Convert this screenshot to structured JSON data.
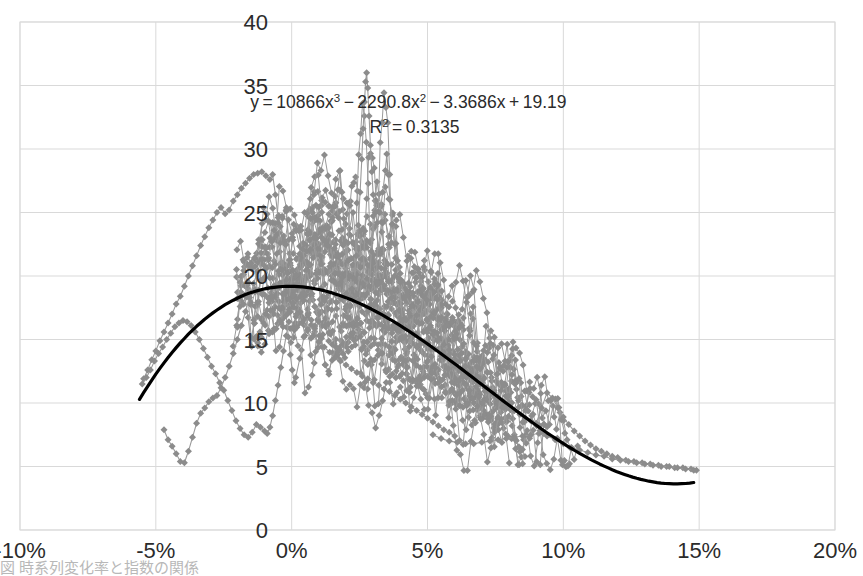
{
  "chart_data": {
    "type": "scatter",
    "title": "",
    "xlabel": "",
    "ylabel": "",
    "xlim": [
      -10,
      20
    ],
    "ylim": [
      0,
      40
    ],
    "xticks": [
      "-10%",
      "-5%",
      "0%",
      "5%",
      "10%",
      "15%",
      "20%"
    ],
    "xtick_values": [
      -10,
      -5,
      0,
      5,
      10,
      15,
      20
    ],
    "yticks": [
      "0",
      "5",
      "10",
      "15",
      "20",
      "25",
      "30",
      "35",
      "40"
    ],
    "ytick_values": [
      0,
      5,
      10,
      15,
      20,
      25,
      30,
      35,
      40
    ],
    "grid": true,
    "legend": "none",
    "marker": {
      "shape": "diamond",
      "color": "#8c8c8c",
      "size": 7,
      "connected": true,
      "line_color": "#9a9a9a"
    },
    "trendline": {
      "type": "polynomial",
      "order": 3,
      "color": "#000000",
      "width": 3.2,
      "equation": "y = 10866x³ − 2290.8x² − 3.3686x + 19.19",
      "coefficients": {
        "x3": 10866,
        "x2": -2290.8,
        "x1": -3.3686,
        "x0": 19.19
      },
      "r_squared": 0.3135,
      "x_start": -5.6,
      "x_end": 14.9
    },
    "annotations": [
      {
        "name": "trendline-equation",
        "lines": [
          "y = 10866x³ − 2290.8x² − 3.3686x + 19.19",
          "R² = 0.3135"
        ],
        "x": 4.3,
        "y": 33.2
      }
    ],
    "series": [
      {
        "name": "series-1",
        "points": [
          [
            -5.45,
            11.9
          ],
          [
            -5.3,
            12.6
          ],
          [
            -5.15,
            13.4
          ],
          [
            -5.0,
            14.1
          ],
          [
            -4.85,
            14.9
          ],
          [
            -4.7,
            15.6
          ],
          [
            -4.55,
            16.3
          ],
          [
            -4.4,
            17.0
          ],
          [
            -4.25,
            17.8
          ],
          [
            -4.1,
            18.4
          ],
          [
            -3.95,
            19.2
          ],
          [
            -3.8,
            20.0
          ],
          [
            -3.65,
            20.8
          ],
          [
            -3.5,
            21.6
          ],
          [
            -3.35,
            22.4
          ],
          [
            -3.2,
            23.1
          ],
          [
            -3.05,
            23.8
          ],
          [
            -2.9,
            24.4
          ],
          [
            -2.75,
            25.0
          ],
          [
            -2.6,
            25.4
          ],
          [
            -2.45,
            24.9
          ],
          [
            -2.3,
            25.2
          ],
          [
            -2.15,
            25.9
          ],
          [
            -2.0,
            26.4
          ],
          [
            -1.85,
            26.9
          ],
          [
            -1.7,
            27.3
          ],
          [
            -1.55,
            27.7
          ],
          [
            -1.4,
            28.0
          ],
          [
            -1.25,
            28.1
          ],
          [
            -1.1,
            28.2
          ],
          [
            -0.95,
            27.9
          ],
          [
            -0.8,
            27.6
          ],
          [
            -0.7,
            28.0
          ],
          [
            -0.6,
            26.4
          ],
          [
            -0.5,
            24.6
          ],
          [
            -0.42,
            22.6
          ],
          [
            -0.35,
            20.5
          ],
          [
            -0.28,
            18.6
          ],
          [
            -0.2,
            16.9
          ],
          [
            -0.12,
            15.2
          ],
          [
            -0.05,
            13.8
          ],
          [
            0.02,
            12.6
          ],
          [
            0.1,
            11.6
          ]
        ]
      },
      {
        "name": "series-2",
        "points": [
          [
            -5.5,
            11.5
          ],
          [
            -5.35,
            12.0
          ],
          [
            -5.2,
            12.6
          ],
          [
            -5.05,
            13.3
          ],
          [
            -4.9,
            13.9
          ],
          [
            -4.75,
            14.4
          ],
          [
            -4.6,
            15.0
          ],
          [
            -4.45,
            15.5
          ],
          [
            -4.3,
            16.0
          ],
          [
            -4.15,
            16.3
          ],
          [
            -4.0,
            16.5
          ],
          [
            -3.85,
            16.4
          ],
          [
            -3.7,
            16.1
          ],
          [
            -3.55,
            15.6
          ],
          [
            -3.4,
            15.0
          ],
          [
            -3.25,
            14.3
          ],
          [
            -3.1,
            13.6
          ],
          [
            -2.95,
            12.9
          ],
          [
            -2.8,
            12.3
          ],
          [
            -2.65,
            11.6
          ],
          [
            -2.5,
            11.0
          ],
          [
            -2.35,
            10.2
          ],
          [
            -2.2,
            9.4
          ],
          [
            -2.05,
            8.6
          ],
          [
            -1.9,
            8.0
          ],
          [
            -1.75,
            7.5
          ],
          [
            -1.6,
            7.3
          ],
          [
            -1.45,
            7.7
          ],
          [
            -1.3,
            8.3
          ],
          [
            -1.15,
            8.1
          ],
          [
            -1.0,
            7.8
          ],
          [
            -0.9,
            7.6
          ],
          [
            -0.8,
            8.1
          ],
          [
            -0.7,
            9.0
          ],
          [
            -0.6,
            10.2
          ],
          [
            -0.5,
            11.4
          ],
          [
            -0.4,
            12.8
          ],
          [
            -0.3,
            14.1
          ],
          [
            -0.2,
            15.3
          ],
          [
            -0.1,
            16.4
          ]
        ]
      },
      {
        "name": "series-3",
        "points": [
          [
            -4.7,
            7.9
          ],
          [
            -4.55,
            7.1
          ],
          [
            -4.4,
            6.6
          ],
          [
            -4.25,
            6.0
          ],
          [
            -4.1,
            5.4
          ],
          [
            -3.95,
            5.3
          ],
          [
            -3.8,
            6.2
          ],
          [
            -3.65,
            7.3
          ],
          [
            -3.5,
            8.4
          ],
          [
            -3.35,
            9.2
          ],
          [
            -3.2,
            9.6
          ],
          [
            -3.05,
            10.1
          ],
          [
            -2.9,
            10.4
          ],
          [
            -2.75,
            10.6
          ],
          [
            -2.6,
            11.2
          ],
          [
            -2.45,
            12.0
          ],
          [
            -2.3,
            12.9
          ],
          [
            -2.15,
            13.9
          ],
          [
            -2.0,
            15.0
          ],
          [
            -1.85,
            16.1
          ],
          [
            -1.7,
            17.2
          ],
          [
            -1.55,
            18.3
          ],
          [
            -1.4,
            19.4
          ],
          [
            -1.25,
            20.4
          ],
          [
            -1.1,
            21.3
          ],
          [
            -0.95,
            22.2
          ],
          [
            -0.8,
            23.0
          ],
          [
            -0.65,
            23.6
          ],
          [
            -0.5,
            24.2
          ],
          [
            -0.35,
            24.7
          ],
          [
            -0.2,
            25.1
          ],
          [
            -0.05,
            25.3
          ],
          [
            0.1,
            24.8
          ],
          [
            0.25,
            23.6
          ],
          [
            0.4,
            22.1
          ],
          [
            0.55,
            20.5
          ],
          [
            0.7,
            19.0
          ],
          [
            0.85,
            17.6
          ],
          [
            1.0,
            16.4
          ],
          [
            1.15,
            15.4
          ]
        ]
      },
      {
        "name": "series-4",
        "points": [
          [
            0.15,
            12.0
          ],
          [
            0.3,
            13.5
          ],
          [
            0.45,
            15.2
          ],
          [
            0.6,
            16.9
          ],
          [
            0.75,
            18.6
          ],
          [
            0.9,
            20.2
          ],
          [
            1.05,
            21.6
          ],
          [
            1.2,
            22.8
          ],
          [
            1.35,
            23.8
          ],
          [
            1.5,
            24.6
          ],
          [
            1.6,
            25.5
          ],
          [
            1.7,
            26.8
          ],
          [
            1.78,
            28.3
          ],
          [
            1.85,
            26.6
          ],
          [
            1.92,
            24.5
          ],
          [
            2.0,
            22.7
          ],
          [
            2.08,
            21.2
          ],
          [
            2.15,
            20.0
          ],
          [
            2.22,
            19.0
          ],
          [
            2.3,
            19.8
          ],
          [
            2.38,
            21.6
          ],
          [
            2.45,
            24.0
          ],
          [
            2.52,
            26.6
          ],
          [
            2.58,
            29.2
          ],
          [
            2.63,
            31.6
          ],
          [
            2.68,
            33.7
          ],
          [
            2.72,
            35.3
          ],
          [
            2.76,
            36.0
          ],
          [
            2.8,
            34.8
          ],
          [
            2.85,
            32.6
          ],
          [
            2.9,
            30.3
          ],
          [
            2.95,
            28.2
          ],
          [
            3.0,
            26.4
          ],
          [
            3.08,
            25.0
          ],
          [
            3.15,
            24.2
          ],
          [
            3.25,
            25.0
          ],
          [
            3.35,
            26.6
          ],
          [
            3.45,
            28.3
          ],
          [
            3.5,
            29.6
          ],
          [
            3.55,
            28.0
          ],
          [
            3.62,
            26.0
          ],
          [
            3.7,
            24.1
          ],
          [
            3.8,
            22.5
          ],
          [
            3.9,
            21.2
          ],
          [
            4.0,
            20.2
          ]
        ]
      },
      {
        "name": "series-5",
        "points": [
          [
            0.2,
            17.0
          ],
          [
            0.4,
            16.4
          ],
          [
            0.6,
            15.8
          ],
          [
            0.8,
            15.3
          ],
          [
            1.0,
            14.8
          ],
          [
            1.2,
            14.4
          ],
          [
            1.4,
            14.0
          ],
          [
            1.6,
            13.6
          ],
          [
            1.8,
            13.3
          ],
          [
            2.0,
            13.0
          ],
          [
            2.2,
            12.7
          ],
          [
            2.4,
            12.4
          ],
          [
            2.6,
            12.1
          ],
          [
            2.8,
            11.9
          ],
          [
            3.0,
            11.6
          ],
          [
            3.2,
            11.4
          ],
          [
            3.4,
            11.1
          ],
          [
            3.6,
            10.9
          ],
          [
            3.8,
            10.6
          ],
          [
            4.0,
            10.3
          ],
          [
            4.2,
            10.0
          ],
          [
            4.4,
            9.7
          ],
          [
            4.6,
            9.4
          ],
          [
            4.8,
            9.1
          ],
          [
            5.0,
            8.8
          ],
          [
            5.2,
            8.5
          ],
          [
            5.4,
            8.2
          ],
          [
            5.6,
            7.9
          ],
          [
            5.8,
            7.7
          ],
          [
            6.0,
            7.4
          ]
        ]
      },
      {
        "name": "series-6",
        "points": [
          [
            4.0,
            19.5
          ],
          [
            4.2,
            18.4
          ],
          [
            4.4,
            17.6
          ],
          [
            4.6,
            16.9
          ],
          [
            4.8,
            16.3
          ],
          [
            5.0,
            15.8
          ],
          [
            5.2,
            15.4
          ],
          [
            5.4,
            15.0
          ],
          [
            5.6,
            14.6
          ],
          [
            5.8,
            14.2
          ],
          [
            6.0,
            13.8
          ],
          [
            6.2,
            13.3
          ],
          [
            6.4,
            12.9
          ],
          [
            6.6,
            12.4
          ],
          [
            6.8,
            12.0
          ],
          [
            7.0,
            11.6
          ],
          [
            7.2,
            11.2
          ],
          [
            7.4,
            10.8
          ],
          [
            7.6,
            10.4
          ],
          [
            7.8,
            10.1
          ],
          [
            8.0,
            9.7
          ],
          [
            8.2,
            9.4
          ],
          [
            8.4,
            9.1
          ],
          [
            8.6,
            8.8
          ],
          [
            8.8,
            8.6
          ],
          [
            9.0,
            8.4
          ],
          [
            9.2,
            9.6
          ],
          [
            9.4,
            10.8
          ],
          [
            9.6,
            10.4
          ],
          [
            9.8,
            9.6
          ],
          [
            10.0,
            8.9
          ],
          [
            10.2,
            8.3
          ],
          [
            10.4,
            7.8
          ],
          [
            10.6,
            7.4
          ],
          [
            10.8,
            7.0
          ],
          [
            11.0,
            6.7
          ],
          [
            11.2,
            6.4
          ],
          [
            11.4,
            6.2
          ],
          [
            11.6,
            6.0
          ],
          [
            11.8,
            5.8
          ],
          [
            12.0,
            5.7
          ],
          [
            12.3,
            5.5
          ],
          [
            12.6,
            5.4
          ],
          [
            12.9,
            5.3
          ],
          [
            13.2,
            5.2
          ],
          [
            13.5,
            5.1
          ],
          [
            13.8,
            5.0
          ],
          [
            14.1,
            4.9
          ],
          [
            14.4,
            4.9
          ],
          [
            14.7,
            4.8
          ],
          [
            14.9,
            4.7
          ]
        ]
      },
      {
        "name": "series-7",
        "points": [
          [
            5.2,
            7.5
          ],
          [
            5.5,
            7.2
          ],
          [
            5.8,
            7.0
          ],
          [
            6.1,
            6.9
          ],
          [
            6.4,
            6.8
          ],
          [
            6.7,
            6.8
          ],
          [
            7.0,
            6.9
          ],
          [
            7.3,
            7.0
          ],
          [
            7.6,
            7.1
          ],
          [
            7.9,
            7.2
          ],
          [
            8.2,
            7.3
          ],
          [
            8.5,
            7.4
          ],
          [
            8.8,
            7.5
          ],
          [
            9.1,
            7.6
          ],
          [
            9.4,
            7.4
          ],
          [
            9.7,
            7.1
          ],
          [
            10.0,
            6.8
          ],
          [
            10.3,
            6.5
          ],
          [
            10.6,
            6.3
          ],
          [
            10.9,
            6.1
          ],
          [
            11.2,
            5.9
          ],
          [
            11.5,
            5.8
          ],
          [
            11.8,
            5.6
          ],
          [
            12.1,
            5.5
          ],
          [
            12.4,
            5.4
          ],
          [
            12.7,
            5.3
          ],
          [
            13.0,
            5.2
          ],
          [
            13.3,
            5.1
          ],
          [
            13.6,
            5.0
          ],
          [
            13.9,
            5.0
          ],
          [
            14.2,
            4.9
          ],
          [
            14.5,
            4.8
          ],
          [
            14.8,
            4.7
          ]
        ]
      }
    ],
    "cloud": {
      "description": "dense overlapping scatter cloud of many series in the central region",
      "x_range": [
        -1.0,
        10.5
      ],
      "y_range": [
        5,
        30
      ],
      "density": 980
    }
  },
  "caption": {
    "text": "図 時系列変化率と指数の関係"
  }
}
